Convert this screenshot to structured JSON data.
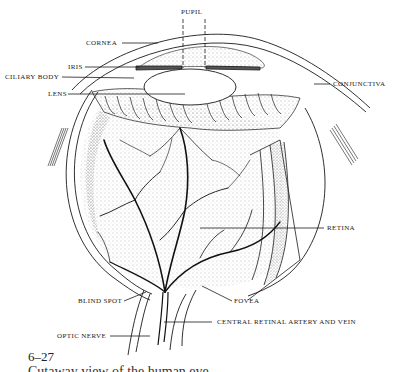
{
  "figure": {
    "number": "6–27",
    "caption": "Cutaway view of the human eye"
  },
  "labels": {
    "pupil": "PUPIL",
    "cornea": "CORNEA",
    "iris": "IRIS",
    "ciliary_body": "CILIARY BODY",
    "lens": "LENS",
    "conjunctiva": "CONJUNCTIVA",
    "retina": "RETINA",
    "blind_spot": "BLIND SPOT",
    "fovea": "FOVEA",
    "central_retinal": "CENTRAL RETINAL ARTERY AND VEIN",
    "optic_nerve": "OPTIC NERVE"
  },
  "colors": {
    "ink": "#1a1a1a",
    "paper": "#ffffff",
    "stipple": "#6a6a6a"
  }
}
